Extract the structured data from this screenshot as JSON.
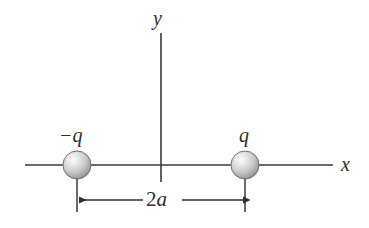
{
  "figure": {
    "background_color": "#ffffff",
    "line_color": "#3a3a3a",
    "text_color": "#2e2e2e",
    "sphere_fill_light": "#f2f2f2",
    "sphere_fill_mid": "#c9c9c9",
    "sphere_fill_dark": "#8e8e8e",
    "sphere_outline": "#6f6f6f"
  },
  "axes": {
    "x_label": "x",
    "y_label": "y",
    "x_axis": {
      "x1": 25,
      "x2": 333,
      "y": 165
    },
    "y_axis": {
      "x": 161,
      "y1": 33,
      "y2": 182
    }
  },
  "charges": [
    {
      "label": "−q",
      "sign": "negative",
      "value": "-q",
      "center_x": 77,
      "center_y": 165,
      "radius": 14
    },
    {
      "label": "q",
      "sign": "positive",
      "value": "q",
      "center_x": 245,
      "center_y": 165,
      "radius": 14
    }
  ],
  "dimension": {
    "label_number": "2",
    "label_variable": "a",
    "label_full": "2a",
    "y": 200,
    "left_x": 77,
    "right_x": 245,
    "extension_top": 178,
    "extension_bottom": 212
  }
}
